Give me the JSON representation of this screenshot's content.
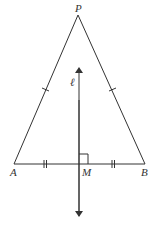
{
  "diagram": {
    "type": "isosceles-triangle-perpendicular-bisector",
    "labels": {
      "apex": "P",
      "left_vertex": "A",
      "right_vertex": "B",
      "midpoint": "M",
      "line": "ℓ"
    },
    "colors": {
      "stroke": "#333333",
      "background": "#ffffff"
    }
  }
}
